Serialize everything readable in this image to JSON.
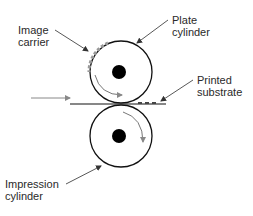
{
  "diagram": {
    "labels": {
      "image_carrier": [
        "Image",
        "carrier"
      ],
      "plate_cylinder": [
        "Plate",
        "cylinder"
      ],
      "printed_substrate": [
        "Printed",
        "substrate"
      ],
      "impression_cylinder": [
        "Impression",
        "cylinder"
      ]
    },
    "components": [
      {
        "name": "plate-cylinder",
        "role": "rotates clockwise"
      },
      {
        "name": "impression-cylinder",
        "role": "rotates clockwise"
      },
      {
        "name": "substrate",
        "role": "fed left to right between cylinders"
      }
    ],
    "colors": {
      "line": "#111111",
      "arrow_gray": "#777777",
      "ink_gray": "#999999"
    }
  }
}
